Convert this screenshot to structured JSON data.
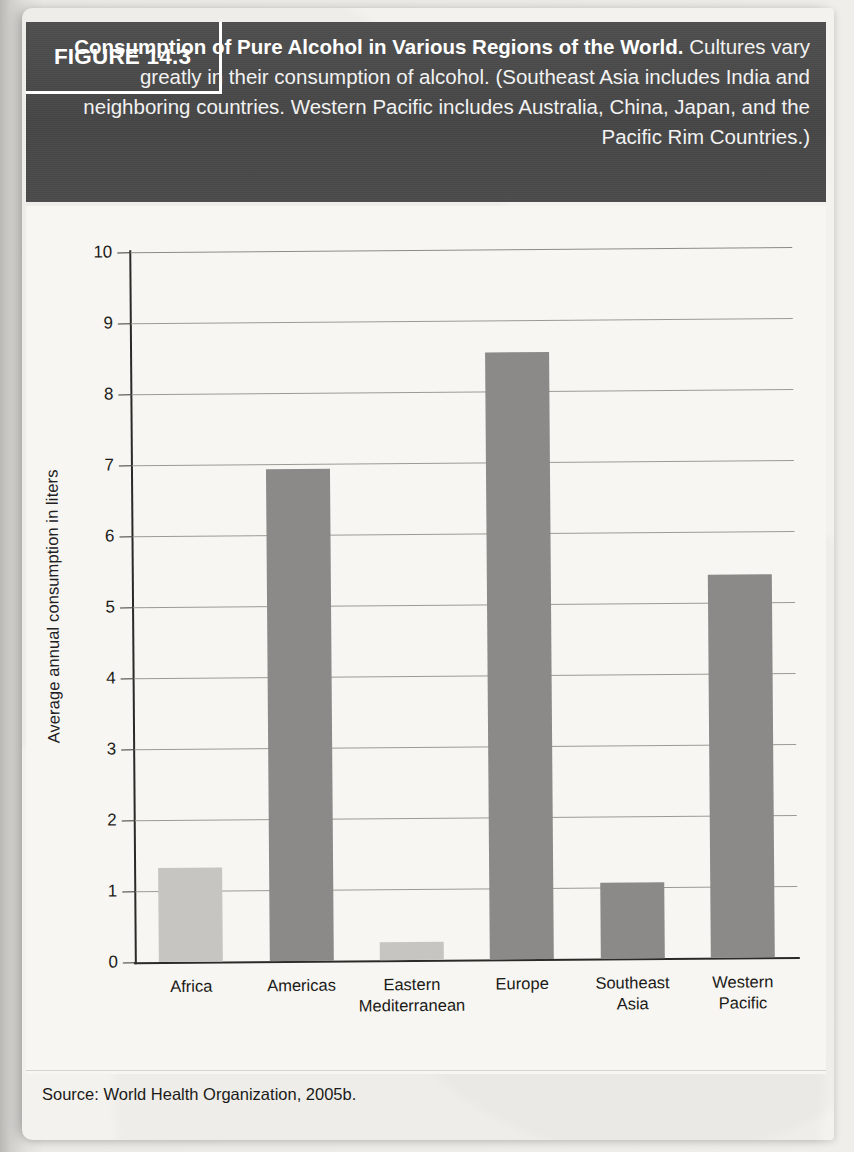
{
  "figure": {
    "tag": "FIGURE 14.3",
    "caption_bold": "Consumption of Pure Alcohol in Various Regions of the World.",
    "caption_rest": " Cultures vary greatly in their consumption of alcohol. (Southeast Asia includes India and neighboring countries. Western Pacific includes Australia, China, Japan, and the Pacific Rim Countries.)",
    "source": "Source: World Health Organization, 2005b."
  },
  "colors": {
    "banner_bg": "#4a4a4a",
    "banner_text": "#ffffff",
    "page_bg": "#f3f2ee",
    "plot_bg": "#f7f6f2",
    "bar_light": "#c6c5c2",
    "bar_dark": "#8b8a88",
    "axis": "#2b2a28",
    "gridline": "#9c9a95"
  },
  "chart_data": {
    "type": "bar",
    "title": "Consumption of Pure Alcohol in Various Regions of the World",
    "xlabel": "",
    "ylabel": "Average annual consumption in liters",
    "categories": [
      "Africa",
      "Americas",
      "Eastern\nMediterranean",
      "Europe",
      "Southeast\nAsia",
      "Western\nPacific"
    ],
    "values": [
      1.33,
      6.93,
      0.25,
      8.55,
      1.07,
      5.4
    ],
    "bar_colors": [
      "#c6c5c2",
      "#8b8a88",
      "#c6c5c2",
      "#8b8a88",
      "#8b8a88",
      "#8b8a88"
    ],
    "ylim": [
      0,
      10
    ],
    "yticks": [
      0,
      1,
      2,
      3,
      4,
      5,
      6,
      7,
      8,
      9,
      10
    ],
    "ytick_labels": [
      "0",
      "1",
      "2",
      "3",
      "4",
      "5",
      "6",
      "7",
      "8",
      "9",
      "10"
    ],
    "grid": true,
    "legend": null
  }
}
